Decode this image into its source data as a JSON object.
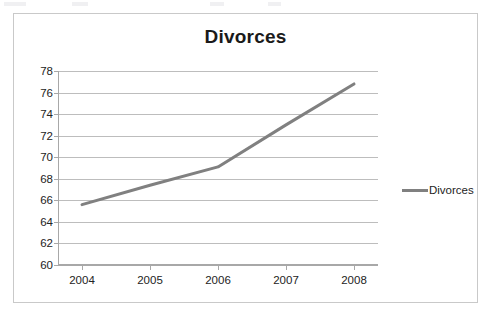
{
  "chart_data": {
    "type": "line",
    "title": "Divorces",
    "xlabel": "",
    "ylabel": "",
    "categories": [
      "2004",
      "2005",
      "2006",
      "2007",
      "2008"
    ],
    "series": [
      {
        "name": "Divorces",
        "color": "#808080",
        "values": [
          65.6,
          67.4,
          69.1,
          73.0,
          76.8
        ]
      }
    ],
    "ylim": [
      60,
      78
    ],
    "ytick_step": 2,
    "yticks": [
      "78",
      "76",
      "74",
      "72",
      "70",
      "68",
      "66",
      "64",
      "62",
      "60"
    ],
    "xticks": [
      "2004",
      "2005",
      "2006",
      "2007",
      "2008"
    ],
    "grid": "horizontal",
    "legend_position": "right",
    "legend_entries": [
      "Divorces"
    ]
  },
  "legend": {
    "items": [
      {
        "label": "Divorces",
        "color": "#808080"
      }
    ]
  }
}
